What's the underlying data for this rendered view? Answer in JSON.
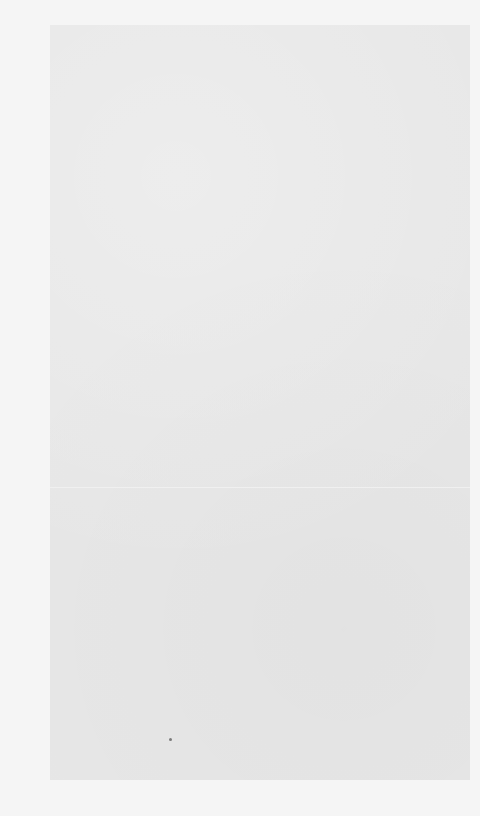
{
  "document": {
    "type": "blank-scanned-page",
    "page_text": "",
    "colors": {
      "margin": "#f5f5f5",
      "paper": "#e7e7e7",
      "fold_line": "#f2f2f2",
      "speck": "#7a7a7a"
    },
    "features": {
      "fold_line": true,
      "speck": true
    }
  }
}
